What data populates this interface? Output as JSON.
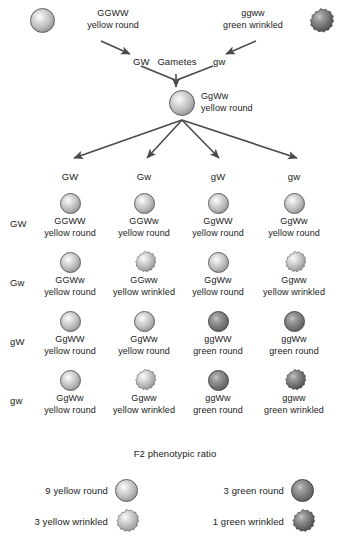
{
  "figure": {
    "type": "dihybrid-cross-punnett-square",
    "colors": {
      "light_sphere": "#b9b9b9",
      "dark_sphere": "#767676",
      "arrow": "#4a4a4a",
      "text": "#1a1a1a",
      "background": "#ffffff"
    }
  },
  "parents": {
    "left": {
      "genotype": "GGWW",
      "phenotype": "yellow round",
      "shape": "round",
      "shade": "light"
    },
    "right": {
      "genotype": "ggww",
      "phenotype": "green wrinkled",
      "shape": "wrinkled",
      "shade": "dark"
    }
  },
  "gametes_row": {
    "left_gamete": "GW",
    "center_label": "Gametes",
    "right_gamete": "gw"
  },
  "f1": {
    "genotype": "GgWw",
    "phenotype": "yellow round",
    "shape": "round",
    "shade": "light"
  },
  "punnett": {
    "column_headers": [
      "GW",
      "Gw",
      "gW",
      "gw"
    ],
    "row_headers": [
      "GW",
      "Gw",
      "gW",
      "gw"
    ],
    "cells": [
      [
        {
          "genotype": "GGWW",
          "phenotype": "yellow round",
          "shape": "round",
          "shade": "light"
        },
        {
          "genotype": "GGWw",
          "phenotype": "yellow round",
          "shape": "round",
          "shade": "light"
        },
        {
          "genotype": "GgWW",
          "phenotype": "yellow round",
          "shape": "round",
          "shade": "light"
        },
        {
          "genotype": "GgWw",
          "phenotype": "yellow round",
          "shape": "round",
          "shade": "light"
        }
      ],
      [
        {
          "genotype": "GGWw",
          "phenotype": "yellow round",
          "shape": "round",
          "shade": "light"
        },
        {
          "genotype": "GGww",
          "phenotype": "yellow wrinkled",
          "shape": "wrinkled",
          "shade": "light"
        },
        {
          "genotype": "GgWw",
          "phenotype": "yellow round",
          "shape": "round",
          "shade": "light"
        },
        {
          "genotype": "Ggww",
          "phenotype": "yellow wrinkled",
          "shape": "wrinkled",
          "shade": "light"
        }
      ],
      [
        {
          "genotype": "GgWW",
          "phenotype": "yellow round",
          "shape": "round",
          "shade": "light"
        },
        {
          "genotype": "GgWw",
          "phenotype": "yellow round",
          "shape": "round",
          "shade": "light"
        },
        {
          "genotype": "ggWW",
          "phenotype": "green round",
          "shape": "round",
          "shade": "dark"
        },
        {
          "genotype": "ggWw",
          "phenotype": "green round",
          "shape": "round",
          "shade": "dark"
        }
      ],
      [
        {
          "genotype": "GgWw",
          "phenotype": "yellow round",
          "shape": "round",
          "shade": "light"
        },
        {
          "genotype": "Ggww",
          "phenotype": "yellow wrinkled",
          "shape": "wrinkled",
          "shade": "light"
        },
        {
          "genotype": "ggWw",
          "phenotype": "green round",
          "shape": "round",
          "shade": "dark"
        },
        {
          "genotype": "ggww",
          "phenotype": "green wrinkled",
          "shape": "wrinkled",
          "shade": "dark"
        }
      ]
    ]
  },
  "ratio_section": {
    "title": "F2 phenotypic ratio",
    "entries": [
      {
        "label": "9 yellow round",
        "shape": "round",
        "shade": "light",
        "count": "9"
      },
      {
        "label": "3 green round",
        "shape": "round",
        "shade": "dark",
        "count": "3"
      },
      {
        "label": "3 yellow wrinkled",
        "shape": "wrinkled",
        "shade": "light",
        "count": "3"
      },
      {
        "label": "1 green wrinkled",
        "shape": "wrinkled",
        "shade": "dark",
        "count": "1"
      }
    ]
  }
}
